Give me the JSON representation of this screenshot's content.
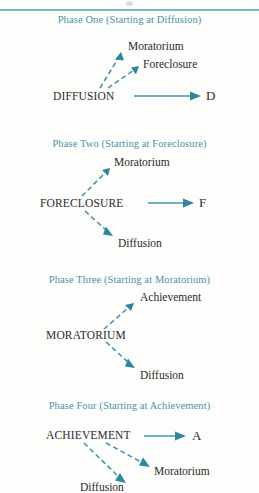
{
  "figure": {
    "background_color": "#fdfdfc",
    "accent_color": "#4a93a5",
    "arrow_color": "#3f93a6",
    "text_color": "#2b2b2b",
    "rule_color": "#6fb5bf"
  },
  "phases": [
    {
      "title": "Phase One (Starting at Diffusion)",
      "source": "DIFFUSION",
      "outcome": "D",
      "targets": [
        "Moratorium",
        "Foreclosure"
      ]
    },
    {
      "title": "Phase Two (Starting at Foreclosure)",
      "source": "FORECLOSURE",
      "outcome": "F",
      "targets": [
        "Moratorium",
        "Diffusion"
      ]
    },
    {
      "title": "Phase Three (Starting at Moratorium)",
      "source": "MORATORIUM",
      "outcome": "",
      "targets": [
        "Achievement",
        "Diffusion"
      ]
    },
    {
      "title": "Phase Four (Starting at Achievement)",
      "source": "ACHIEVEMENT",
      "outcome": "A",
      "targets": [
        "Moratorium",
        "Diffusion"
      ]
    }
  ]
}
